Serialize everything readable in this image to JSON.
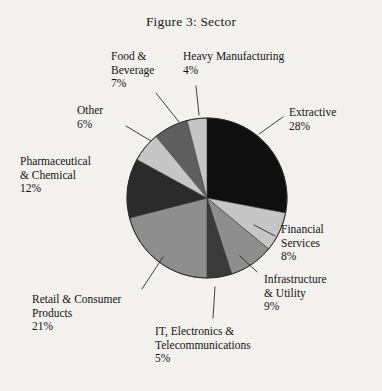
{
  "figure": {
    "title": "Figure 3: Sector",
    "background_color": "#f2f1ee",
    "text_color": "#141414"
  },
  "chart_data": {
    "type": "pie",
    "title": "Figure 3: Sector",
    "xlabel": "",
    "ylabel": "",
    "legend_position": "none",
    "labels_position": "outside-with-leader-lines",
    "start_angle_deg": 0,
    "direction": "clockwise",
    "categories": [
      "Extractive",
      "Financial Services",
      "Infrastructure & Utility",
      "IT, Electronics & Telecommunications",
      "Retail & Consumer Products",
      "Pharmaceutical & Chemical",
      "Other",
      "Food & Beverage",
      "Heavy Manufacturing"
    ],
    "values": [
      28,
      8,
      9,
      5,
      21,
      12,
      6,
      7,
      4
    ],
    "value_labels": [
      "28%",
      "8%",
      "9%",
      "5%",
      "21%",
      "12%",
      "6%",
      "7%",
      "4%"
    ],
    "colors": [
      "#0f0f0f",
      "#c6c6c6",
      "#8e8e8e",
      "#3a3a3a",
      "#8e8e8e",
      "#2b2b2b",
      "#c6c6c6",
      "#5e5e5e",
      "#c6c6c6"
    ],
    "slices": [
      {
        "label": "Extractive",
        "pct_text": "28%",
        "value": 28,
        "color": "#0f0f0f"
      },
      {
        "label": "Financial Services",
        "pct_text": "8%",
        "value": 8,
        "color": "#c6c6c6"
      },
      {
        "label": "Infrastructure & Utility",
        "pct_text": "9%",
        "value": 9,
        "color": "#8e8e8e"
      },
      {
        "label": "IT, Electronics & Telecommunications",
        "pct_text": "5%",
        "value": 5,
        "color": "#3a3a3a"
      },
      {
        "label": "Retail & Consumer Products",
        "pct_text": "21%",
        "value": 21,
        "color": "#8e8e8e"
      },
      {
        "label": "Pharmaceutical & Chemical",
        "pct_text": "12%",
        "value": 12,
        "color": "#2b2b2b"
      },
      {
        "label": "Other",
        "pct_text": "6%",
        "value": 6,
        "color": "#c6c6c6"
      },
      {
        "label": "Food & Beverage",
        "pct_text": "7%",
        "value": 7,
        "color": "#5e5e5e"
      },
      {
        "label": "Heavy Manufacturing",
        "pct_text": "4%",
        "value": 4,
        "color": "#c6c6c6"
      }
    ]
  },
  "labels": {
    "heavy_manufacturing": {
      "line1": "Heavy Manufacturing",
      "pct": "4%"
    },
    "food_beverage": {
      "line1": "Food &",
      "line2": "Beverage",
      "pct": "7%"
    },
    "other": {
      "line1": "Other",
      "pct": "6%"
    },
    "pharmaceutical": {
      "line1": "Pharmaceutical",
      "line2": "& Chemical",
      "pct": "12%"
    },
    "retail": {
      "line1": "Retail & Consumer",
      "line2": "Products",
      "pct": "21%"
    },
    "it_electronics": {
      "line1": "IT, Electronics &",
      "line2": "Telecommunications",
      "pct": "5%"
    },
    "infrastructure": {
      "line1": "Infrastructure",
      "line2": "& Utility",
      "pct": "9%"
    },
    "financial": {
      "line1": "Financial",
      "line2": "Services",
      "pct": "8%"
    },
    "extractive": {
      "line1": "Extractive",
      "pct": "28%"
    }
  }
}
